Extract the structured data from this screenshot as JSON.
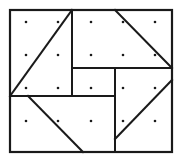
{
  "figure": {
    "name": "pinwheel-quilt-block-dot-grid",
    "canvas": {
      "width": 184,
      "height": 166,
      "background": "#ffffff"
    },
    "stroke_color": "#1a1a1a",
    "dot_color": "#1a1a1a",
    "border_width": 2.2,
    "line_width": 2.0,
    "diagonal_width": 2.0,
    "dot_radius": 1.3,
    "frame": {
      "x1": 10,
      "y1": 10,
      "x2": 172,
      "y2": 152
    },
    "interior_lines": [
      {
        "name": "vertical-upper-left-divider",
        "x1": 72,
        "y1": 10,
        "x2": 72,
        "y2": 96
      },
      {
        "name": "horizontal-upper-right-divider",
        "x1": 72,
        "y1": 68,
        "x2": 172,
        "y2": 68
      },
      {
        "name": "vertical-lower-right-divider",
        "x1": 115,
        "y1": 68,
        "x2": 115,
        "y2": 152
      },
      {
        "name": "horizontal-lower-left-divider",
        "x1": 10,
        "y1": 96,
        "x2": 115,
        "y2": 96
      }
    ],
    "diagonals": [
      {
        "name": "diagonal-top-left",
        "x1": 10,
        "y1": 96,
        "x2": 72,
        "y2": 10
      },
      {
        "name": "diagonal-top-right",
        "x1": 115,
        "y1": 10,
        "x2": 172,
        "y2": 68
      },
      {
        "name": "diagonal-bottom-left",
        "x1": 28,
        "y1": 96,
        "x2": 83,
        "y2": 152
      },
      {
        "name": "diagonal-bottom-right",
        "x1": 115,
        "y1": 139,
        "x2": 172,
        "y2": 80
      }
    ],
    "dot_grid": {
      "columns": 5,
      "rows": 4,
      "x_positions": [
        26,
        58,
        91,
        123,
        155
      ],
      "y_positions": [
        22,
        55,
        88,
        121
      ],
      "total_dots": 20
    }
  }
}
